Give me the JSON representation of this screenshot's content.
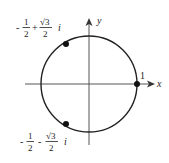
{
  "diagram": {
    "axes": {
      "x_label": "x",
      "y_label": "y"
    },
    "circle": {
      "center": [
        0,
        0
      ],
      "radius": 1
    },
    "points": [
      {
        "name": "root-1",
        "label": "1",
        "re": 1,
        "im": 0
      },
      {
        "name": "root-upper",
        "label_parts": {
          "sign1": "-",
          "num1": "1",
          "den1": "2",
          "op": "+",
          "num2": "√3",
          "den2": "2",
          "unit": "i"
        },
        "re": -0.5,
        "im": 0.866
      },
      {
        "name": "root-lower",
        "label_parts": {
          "sign1": "-",
          "num1": "1",
          "den1": "2",
          "op": "-",
          "num2": "√3",
          "den2": "2",
          "unit": "i"
        },
        "re": -0.5,
        "im": -0.866
      }
    ],
    "colors": {
      "stroke": "#222222",
      "axis": "#555555",
      "background": "#ffffff"
    }
  }
}
